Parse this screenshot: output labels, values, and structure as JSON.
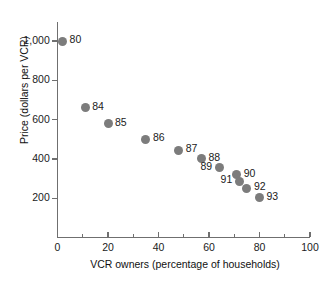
{
  "chart_data": {
    "type": "scatter",
    "title": "",
    "xlabel": "VCR owners (percentage of households)",
    "ylabel": "Price (dollars per VCR)",
    "xlim": [
      0,
      100
    ],
    "ylim": [
      0,
      1000
    ],
    "grid": false,
    "legend": "none",
    "point_color": "#7c7c7c",
    "xticks": [
      "0",
      "20",
      "40",
      "60",
      "80",
      "100"
    ],
    "xtick_values": [
      0,
      20,
      40,
      60,
      80,
      100
    ],
    "yticks": [
      "200",
      "400",
      "600",
      "800",
      "1,000"
    ],
    "ytick_values": [
      200,
      400,
      600,
      800,
      1000
    ],
    "points": [
      {
        "label": "80",
        "x": 2,
        "y": 1000,
        "label_side": "right"
      },
      {
        "label": "84",
        "x": 11,
        "y": 660,
        "label_side": "right"
      },
      {
        "label": "85",
        "x": 20,
        "y": 580,
        "label_side": "right"
      },
      {
        "label": "86",
        "x": 35,
        "y": 500,
        "label_side": "right"
      },
      {
        "label": "87",
        "x": 48,
        "y": 445,
        "label_side": "right"
      },
      {
        "label": "88",
        "x": 57,
        "y": 400,
        "label_side": "right"
      },
      {
        "label": "89",
        "x": 64,
        "y": 355,
        "label_side": "left"
      },
      {
        "label": "90",
        "x": 71,
        "y": 320,
        "label_side": "right"
      },
      {
        "label": "91",
        "x": 72,
        "y": 285,
        "label_side": "left"
      },
      {
        "label": "92",
        "x": 75,
        "y": 250,
        "label_side": "right"
      },
      {
        "label": "93",
        "x": 80,
        "y": 203,
        "label_side": "right"
      }
    ]
  }
}
